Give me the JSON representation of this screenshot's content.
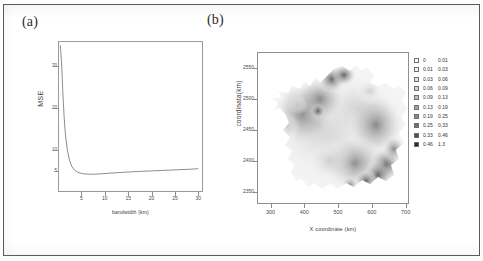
{
  "figure": {
    "panel_a_label": "(a)",
    "panel_b_label": "(b)"
  },
  "chart_data": [
    {
      "type": "line",
      "panel": "(a)",
      "title": "",
      "xlabel": "bandwidth (km)",
      "ylabel": "MSE",
      "xlim": [
        0,
        31
      ],
      "ylim": [
        0,
        36
      ],
      "grid": false,
      "legend": "none",
      "xticks": [
        5,
        10,
        15,
        20,
        25,
        30
      ],
      "yticks": [
        5,
        10,
        20,
        30
      ],
      "ytick_labels": [
        "5",
        "10",
        "20",
        "30"
      ],
      "x": [
        0.5,
        0.8,
        1.0,
        1.3,
        1.6,
        2.0,
        2.5,
        3.0,
        3.5,
        4.0,
        4.5,
        5.0,
        5.5,
        6.0,
        6.5,
        7.0,
        7.5,
        8.0,
        9.0,
        10.0,
        11.0,
        12.0,
        13.0,
        14.0,
        15.0,
        16.0,
        17.0,
        18.0,
        19.0,
        20.0,
        22.0,
        24.0,
        26.0,
        28.0,
        30.0
      ],
      "y": [
        35.0,
        30.0,
        24.5,
        18.0,
        13.5,
        10.0,
        7.4,
        6.0,
        5.3,
        4.85,
        4.6,
        4.45,
        4.35,
        4.3,
        4.26,
        4.24,
        4.24,
        4.26,
        4.32,
        4.4,
        4.48,
        4.56,
        4.63,
        4.7,
        4.76,
        4.82,
        4.88,
        4.93,
        4.98,
        5.03,
        5.13,
        5.22,
        5.32,
        5.42,
        5.55
      ],
      "minimum_x": 7.3,
      "minimum_y": 4.24
    },
    {
      "type": "heatmap",
      "panel": "(b)",
      "title": "",
      "xlabel": "X coordinate (km)",
      "ylabel": "coordinata(km)",
      "xlim": [
        260,
        710
      ],
      "ylim": [
        2330,
        2575
      ],
      "grid": false,
      "legend_position": "right",
      "xticks": [
        300,
        400,
        500,
        600,
        700
      ],
      "yticks": [
        2350,
        2400,
        2450,
        2500,
        2550
      ],
      "colormap": "grayscale-inverted",
      "legend_title": "",
      "legend_bins": [
        {
          "low": "0",
          "high": "0.01",
          "shade": "#ffffff"
        },
        {
          "low": "0.01",
          "high": "0.03",
          "shade": "#f2f2f2"
        },
        {
          "low": "0.03",
          "high": "0.06",
          "shade": "#e2e2e2"
        },
        {
          "low": "0.06",
          "high": "0.09",
          "shade": "#d0d0d0"
        },
        {
          "low": "0.09",
          "high": "0.13",
          "shade": "#bcbcbc"
        },
        {
          "low": "0.13",
          "high": "0.19",
          "shade": "#a4a4a4"
        },
        {
          "low": "0.19",
          "high": "0.25",
          "shade": "#8a8a8a"
        },
        {
          "low": "0.25",
          "high": "0.33",
          "shade": "#6e6e6e"
        },
        {
          "low": "0.33",
          "high": "0.46",
          "shade": "#4e4e4e"
        },
        {
          "low": "0.46",
          "high": "1.3",
          "shade": "#2b2b2b"
        }
      ]
    }
  ]
}
